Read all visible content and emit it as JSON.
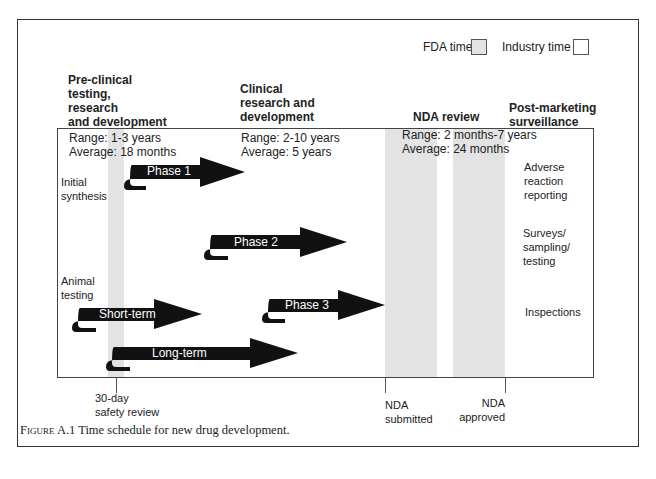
{
  "figure": {
    "caption_prefix": "Figure",
    "caption_number": "A.1",
    "caption_text": "Time schedule for new drug development."
  },
  "legend": {
    "fda_label": "FDA time",
    "industry_label": "Industry time",
    "fda_color": "#e3e3e3",
    "industry_color": "#ffffff"
  },
  "stages": {
    "preclinical": {
      "title_lines": [
        "Pre-clinical",
        "testing,",
        "research",
        "and development"
      ],
      "range": "Range: 1-3 years",
      "average": "Average: 18 months"
    },
    "clinical": {
      "title_lines": [
        "Clinical",
        "research and",
        "development"
      ],
      "range": "Range: 2-10 years",
      "average": "Average: 5 years"
    },
    "nda": {
      "title": "NDA review",
      "range": "Range: 2 months-7 years",
      "average": "Average: 24 months"
    },
    "postmarketing": {
      "title_lines": [
        "Post-marketing",
        "surveillance"
      ],
      "items": [
        [
          "Adverse",
          "reaction",
          "reporting"
        ],
        [
          "Surveys/",
          "sampling/",
          "testing"
        ],
        [
          "Inspections"
        ]
      ]
    }
  },
  "side_labels": {
    "initial_synthesis": [
      "Initial",
      "synthesis"
    ],
    "animal_testing": [
      "Animal",
      "testing"
    ]
  },
  "arrows": {
    "phase1": "Phase 1",
    "phase2": "Phase 2",
    "phase3": "Phase 3",
    "short_term": "Short-term",
    "long_term": "Long-term"
  },
  "milestones": {
    "safety_review": [
      "30-day",
      "safety review"
    ],
    "nda_submitted": [
      "NDA",
      "submitted"
    ],
    "nda_approved": [
      "NDA",
      "approved"
    ]
  }
}
